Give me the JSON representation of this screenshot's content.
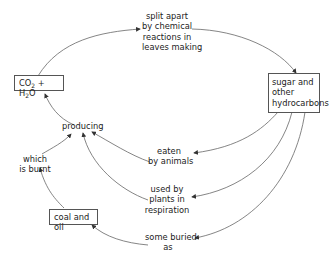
{
  "diagram": {
    "nodes": {
      "co2_h2o": {
        "prefix": "CO",
        "sub1": "2",
        "mid": " + H",
        "sub2": "2",
        "suffix": "O"
      },
      "sugar": {
        "lines": [
          "sugar and",
          "other",
          "hydrocarbons"
        ]
      },
      "coal_oil": {
        "label": "coal and oil"
      }
    },
    "labels": {
      "split": [
        "split apart",
        "by chemical",
        "reactions in",
        "leaves making"
      ],
      "producing": "producing",
      "eaten": [
        "eaten",
        "by animals"
      ],
      "used": [
        "used by",
        "plants in",
        "respiration"
      ],
      "buried": [
        "some buried",
        "as"
      ],
      "burnt": [
        "which",
        "is burnt"
      ]
    },
    "colors": {
      "line": "#555555",
      "text": "#1c1c1c",
      "box_border": "#555555"
    }
  }
}
